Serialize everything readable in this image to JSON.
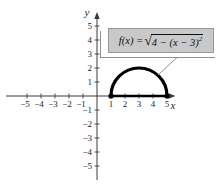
{
  "figure": {
    "background": "#ffffff",
    "axis_color": "#3a3a3a",
    "curve_color": "#000000",
    "x_axis_label": "x",
    "y_axis_label": "y",
    "label_box": {
      "fill": "#c9c9c9",
      "border": "#979797",
      "formula_prefix": "f(x) = ",
      "radical_sign": "√",
      "radicand": "4 − (x − 3)",
      "exponent": "2"
    }
  },
  "chart_data": {
    "type": "line",
    "xlabel": "x",
    "ylabel": "y",
    "xlim": [
      -6,
      6
    ],
    "ylim": [
      -6,
      6
    ],
    "grid": false,
    "legend": "none",
    "x_ticks": [
      -5,
      -4,
      -3,
      -2,
      -1,
      1,
      2,
      3,
      4,
      5
    ],
    "x_tick_labels": [
      "−5",
      "−4",
      "−3",
      "−2",
      "−1",
      "1",
      "2",
      "3",
      "4",
      "5"
    ],
    "y_ticks": [
      5,
      4,
      3,
      2,
      1,
      -1,
      -2,
      -3,
      -4,
      -5
    ],
    "y_tick_labels": [
      "5",
      "4",
      "3",
      "2",
      "1",
      "−1",
      "−2",
      "−3",
      "−4",
      "−5"
    ],
    "series": [
      {
        "name": "f(x) = √(4 − (x − 3)²)",
        "kind": "upper_semicircle",
        "center": [
          3,
          0
        ],
        "radius": 2,
        "domain": [
          1,
          5
        ],
        "points": [
          [
            1,
            0
          ],
          [
            1.5,
            1.32
          ],
          [
            2,
            1.73
          ],
          [
            2.5,
            1.94
          ],
          [
            3,
            2
          ],
          [
            3.5,
            1.94
          ],
          [
            4,
            1.73
          ],
          [
            4.5,
            1.32
          ],
          [
            5,
            0
          ]
        ]
      }
    ],
    "annotation": {
      "text": "f(x) = √4 − (x − 3)²",
      "attached_to": "curve",
      "has_leader_line": true
    }
  }
}
